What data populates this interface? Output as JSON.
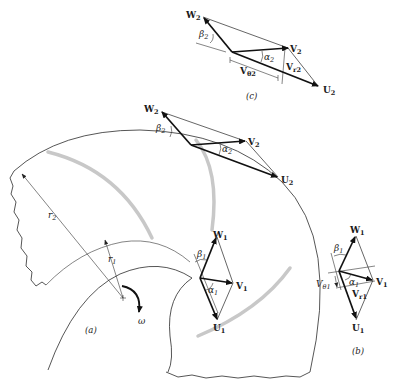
{
  "figure": {
    "panels": {
      "a": {
        "caption": "(a)",
        "omega": "ω",
        "r1": "r",
        "r1_sub": "1",
        "r2": "r",
        "r2_sub": "2"
      },
      "b": {
        "caption": "(b)"
      },
      "c": {
        "caption": "(c)"
      }
    },
    "outlet_triangle": {
      "W": "W",
      "W_sub": "2",
      "V": "V",
      "V_sub": "2",
      "U": "U",
      "U_sub": "2",
      "alpha": "α",
      "alpha_sub": "2",
      "beta": "β",
      "beta_sub": "2"
    },
    "inlet_triangle": {
      "W": "W",
      "W_sub": "1",
      "V": "V",
      "V_sub": "1",
      "U": "U",
      "U_sub": "1",
      "alpha": "α",
      "alpha_sub": "1",
      "beta": "β",
      "beta_sub": "1"
    },
    "panel_b": {
      "W": "W",
      "W_sub": "1",
      "V": "V",
      "V_sub": "1",
      "U": "U",
      "U_sub": "1",
      "alpha": "α",
      "alpha_sub": "1",
      "beta": "β",
      "beta_sub": "1",
      "Vtheta": "V",
      "Vtheta_sub": "θ1",
      "Vr": "V",
      "Vr_sub": "r1"
    },
    "panel_c": {
      "W": "W",
      "W_sub": "2",
      "V": "V",
      "V_sub": "2",
      "U": "U",
      "U_sub": "2",
      "alpha": "α",
      "alpha_sub": "2",
      "beta": "β",
      "beta_sub": "2",
      "Vtheta": "V",
      "Vtheta_sub": "θ2",
      "Vr": "V",
      "Vr_sub": "r2"
    },
    "colors": {
      "line": "#2b2b2b",
      "vector": "#111111",
      "blade": "#c8c8c8",
      "background": "#ffffff"
    }
  }
}
